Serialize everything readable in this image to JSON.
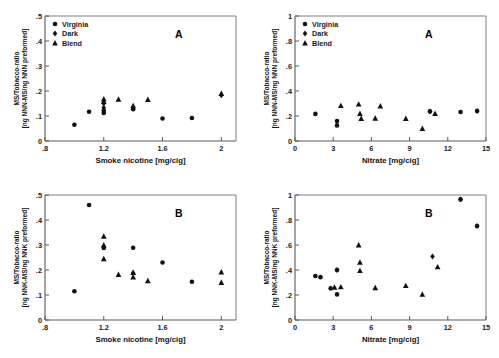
{
  "figure": {
    "background": "#ffffff",
    "marker_color": "#111111",
    "axis_color": "#5a5a5a",
    "panels": [
      "A",
      "B",
      "A",
      "B"
    ]
  },
  "legend": {
    "entries": [
      {
        "label": "Virginia",
        "marker": "circle"
      },
      {
        "label": "Dark",
        "marker": "diamond"
      },
      {
        "label": "Blend",
        "marker": "triangle"
      }
    ]
  },
  "chart_data": [
    {
      "id": "top-left",
      "type": "scatter",
      "title": "",
      "panel_letter": "A",
      "xlabel": "Smoke nicotine [mg/cig]",
      "ylabel": "MS/Tobacco-ratio [ng NNN-MS/ng NNN preformed]",
      "ylabel_line1": "MS/Tobacco-ratio",
      "ylabel_line2": "[ng NNN-MS/ng NNN preformed]",
      "xlim": [
        0.8,
        2.1
      ],
      "ylim": [
        0,
        0.5
      ],
      "xticks": [
        0.8,
        1.2,
        1.6,
        2
      ],
      "xticklabels": [
        ".8",
        "1.2",
        "1.6",
        "2"
      ],
      "yticks": [
        0,
        0.1,
        0.2,
        0.3,
        0.4,
        0.5
      ],
      "yticklabels": [
        "0",
        ".1",
        ".2",
        ".3",
        ".4",
        ".5"
      ],
      "grid": false,
      "legend_position": "upper-left",
      "series": [
        {
          "name": "Virginia",
          "marker": "circle",
          "points": [
            [
              1.0,
              0.065
            ],
            [
              1.1,
              0.117
            ],
            [
              1.2,
              0.112
            ],
            [
              1.2,
              0.122
            ],
            [
              1.4,
              0.127
            ],
            [
              1.6,
              0.09
            ],
            [
              1.8,
              0.092
            ]
          ]
        },
        {
          "name": "Dark",
          "marker": "diamond",
          "points": [
            [
              1.2,
              0.133
            ],
            [
              1.2,
              0.15
            ],
            [
              1.4,
              0.133
            ],
            [
              2.0,
              0.183
            ]
          ]
        },
        {
          "name": "Blend",
          "marker": "triangle",
          "points": [
            [
              1.2,
              0.158
            ],
            [
              1.2,
              0.168
            ],
            [
              1.3,
              0.167
            ],
            [
              1.4,
              0.141
            ],
            [
              1.5,
              0.166
            ],
            [
              2.0,
              0.19
            ]
          ]
        }
      ]
    },
    {
      "id": "top-right",
      "type": "scatter",
      "title": "",
      "panel_letter": "A",
      "xlabel": "Nitrate [mg/cig]",
      "ylabel": "MS/Tobacco-ratio [ng NNN-MS/ng NNN preformed]",
      "ylabel_line1": "MS/Tobacco-ratio",
      "ylabel_line2": "[ng NNN-MS/ng NNN preformed]",
      "xlim": [
        0,
        15
      ],
      "ylim": [
        0,
        1
      ],
      "xticks": [
        0,
        3,
        6,
        9,
        12,
        15
      ],
      "xticklabels": [
        "0",
        "3",
        "6",
        "9",
        "12",
        "15"
      ],
      "yticks": [
        0,
        0.2,
        0.4,
        0.6,
        0.8,
        1
      ],
      "yticklabels": [
        "0",
        ".2",
        ".4",
        ".6",
        ".8",
        "1"
      ],
      "grid": false,
      "legend_position": "upper-left",
      "series": [
        {
          "name": "Virginia",
          "marker": "circle",
          "points": [
            [
              1.6,
              0.217
            ],
            [
              3.3,
              0.125
            ],
            [
              3.3,
              0.16
            ],
            [
              10.6,
              0.237
            ],
            [
              13.0,
              0.232
            ],
            [
              14.3,
              0.24
            ]
          ]
        },
        {
          "name": "Dark",
          "marker": "diamond",
          "points": [
            [
              10.6,
              0.237
            ],
            [
              14.3,
              0.24
            ]
          ]
        },
        {
          "name": "Blend",
          "marker": "triangle",
          "points": [
            [
              3.6,
              0.283
            ],
            [
              5.0,
              0.295
            ],
            [
              5.1,
              0.22
            ],
            [
              5.2,
              0.18
            ],
            [
              6.3,
              0.182
            ],
            [
              6.7,
              0.28
            ],
            [
              8.7,
              0.18
            ],
            [
              10.0,
              0.1
            ],
            [
              11.0,
              0.22
            ]
          ]
        }
      ]
    },
    {
      "id": "bottom-left",
      "type": "scatter",
      "title": "",
      "panel_letter": "B",
      "xlabel": "Smoke nicotine [mg/cig]",
      "ylabel": "MS/Tobacco-ratio [ng NNK-MS/ng NNK preformed]",
      "ylabel_line1": "MS/Tobacco-ratio",
      "ylabel_line2": "[ng NNK-MS/ng NNK preformed]",
      "xlim": [
        0.8,
        2.1
      ],
      "ylim": [
        0,
        0.5
      ],
      "xticks": [
        0.8,
        1.2,
        1.6,
        2
      ],
      "xticklabels": [
        ".8",
        "1.2",
        "1.6",
        "2"
      ],
      "yticks": [
        0,
        0.1,
        0.2,
        0.3,
        0.4,
        0.5
      ],
      "yticklabels": [
        "0",
        ".1",
        ".2",
        ".3",
        ".4",
        ".5"
      ],
      "grid": false,
      "legend_position": "none",
      "series": [
        {
          "name": "Virginia",
          "marker": "circle",
          "points": [
            [
              1.0,
              0.115
            ],
            [
              1.1,
              0.46
            ],
            [
              1.2,
              0.288
            ],
            [
              1.4,
              0.289
            ],
            [
              1.6,
              0.23
            ],
            [
              1.8,
              0.153
            ]
          ]
        },
        {
          "name": "Dark",
          "marker": "diamond",
          "points": [
            [
              1.2,
              0.293
            ],
            [
              1.4,
              0.188
            ]
          ]
        },
        {
          "name": "Blend",
          "marker": "triangle",
          "points": [
            [
              1.2,
              0.335
            ],
            [
              1.2,
              0.3
            ],
            [
              1.2,
              0.245
            ],
            [
              1.3,
              0.182
            ],
            [
              1.4,
              0.19
            ],
            [
              1.4,
              0.172
            ],
            [
              1.5,
              0.157
            ],
            [
              2.0,
              0.192
            ],
            [
              2.0,
              0.15
            ]
          ]
        }
      ]
    },
    {
      "id": "bottom-right",
      "type": "scatter",
      "title": "",
      "panel_letter": "B",
      "xlabel": "Nitrate [mg/cig]",
      "ylabel": "MS/Tobacco-ratio [ng NNK-MS/ng NNK preformed]",
      "ylabel_line1": "MS/Tobacco-ratio",
      "ylabel_line2": "[ng NNK-MS/ng NNK preformed]",
      "xlim": [
        0,
        15
      ],
      "ylim": [
        0,
        1
      ],
      "xticks": [
        0,
        3,
        6,
        9,
        12,
        15
      ],
      "xticklabels": [
        "0",
        "3",
        "6",
        "9",
        "12",
        "15"
      ],
      "yticks": [
        0,
        0.2,
        0.4,
        0.6,
        0.8,
        1
      ],
      "yticklabels": [
        "0",
        ".2",
        ".4",
        ".6",
        ".8",
        "1"
      ],
      "grid": false,
      "legend_position": "none",
      "series": [
        {
          "name": "Virginia",
          "marker": "circle",
          "points": [
            [
              1.6,
              0.352
            ],
            [
              2.0,
              0.343
            ],
            [
              2.8,
              0.253
            ],
            [
              3.3,
              0.4
            ],
            [
              3.3,
              0.205
            ],
            [
              13.0,
              0.965
            ],
            [
              14.3,
              0.752
            ]
          ]
        },
        {
          "name": "Dark",
          "marker": "diamond",
          "points": [
            [
              3.3,
              0.4
            ],
            [
              10.8,
              0.508
            ],
            [
              13.0,
              0.965
            ],
            [
              14.3,
              0.752
            ]
          ]
        },
        {
          "name": "Blend",
          "marker": "triangle",
          "points": [
            [
              3.1,
              0.262
            ],
            [
              3.6,
              0.265
            ],
            [
              5.0,
              0.6
            ],
            [
              5.1,
              0.462
            ],
            [
              5.1,
              0.395
            ],
            [
              6.3,
              0.258
            ],
            [
              8.7,
              0.275
            ],
            [
              10.0,
              0.205
            ],
            [
              11.2,
              0.425
            ]
          ]
        }
      ]
    }
  ]
}
